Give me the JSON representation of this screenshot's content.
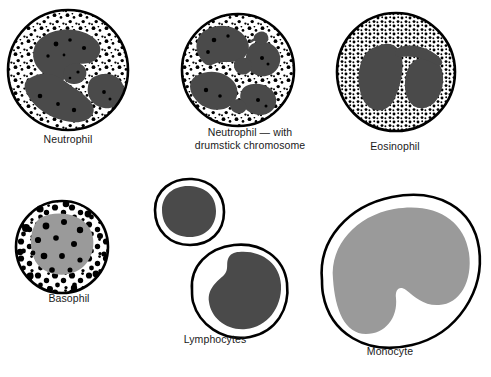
{
  "figure": {
    "kind": "scientific-illustration",
    "background_color": "#ffffff",
    "outline_color": "#000000",
    "dark_nucleus_color": "#4a4a4a",
    "gray_nucleus_color": "#9a9a9a",
    "granule_color": "#000000",
    "cytoplasm_color": "#ffffff",
    "label_color": "#1a1a1a"
  },
  "cells": [
    {
      "id": "neutrophil",
      "label": "Neutrophil",
      "row": 1,
      "column": 1,
      "nucleus": "multi-lobed dark gray nucleus",
      "granules": "fine black speckles throughout cytoplasm",
      "shape": "round"
    },
    {
      "id": "neutrophil-drumstick",
      "label_line1": "Neutrophil — with",
      "label_line2": "drumstick chromosome",
      "label": "Neutrophil — with drumstick chromosome",
      "row": 1,
      "column": 2,
      "nucleus": "multi-lobed dark gray nucleus with small drumstick appendage",
      "granules": "fine black speckles throughout cytoplasm",
      "shape": "round"
    },
    {
      "id": "eosinophil",
      "label": "Eosinophil",
      "row": 1,
      "column": 3,
      "nucleus": "bilobed dark gray nucleus",
      "granules": "dense uniform black granules throughout cytoplasm",
      "shape": "round"
    },
    {
      "id": "basophil",
      "label": "Basophil",
      "row": 2,
      "column": 1,
      "nucleus": "large gray nucleus",
      "granules": "large coarse black granules overlapping nucleus and membrane",
      "shape": "round"
    },
    {
      "id": "lymphocytes",
      "label": "Lymphocytes",
      "row": 2,
      "column": 2,
      "nucleus": "round and kidney-shaped dark gray nuclei",
      "granules": "none",
      "shape": "two cells: small round, large rounded",
      "count": 2
    },
    {
      "id": "monocyte",
      "label": "Monocyte",
      "row": 2,
      "column": 3,
      "nucleus": "large kidney/horseshoe-shaped gray nucleus",
      "granules": "none",
      "shape": "large oval"
    }
  ]
}
